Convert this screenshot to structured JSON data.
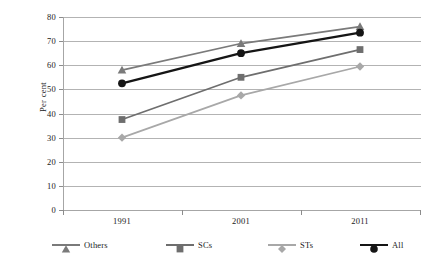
{
  "chart_data": {
    "type": "line",
    "title": "",
    "xlabel": "",
    "ylabel": "Per cent",
    "categories": [
      "1991",
      "2001",
      "2011"
    ],
    "ylim": [
      0,
      80
    ],
    "yticks": [
      0,
      10,
      20,
      30,
      40,
      50,
      60,
      70,
      80
    ],
    "grid": true,
    "legend_position": "bottom",
    "series": [
      {
        "name": "Others",
        "values": [
          58,
          69,
          76
        ],
        "color": "#7a7a7a",
        "marker": "triangle"
      },
      {
        "name": "SCs",
        "values": [
          37.5,
          55,
          66.5
        ],
        "color": "#6e6e6e",
        "marker": "square"
      },
      {
        "name": "STs",
        "values": [
          30,
          47.5,
          59.5
        ],
        "color": "#a8a8a8",
        "marker": "diamond"
      },
      {
        "name": "All",
        "values": [
          52.5,
          65,
          73.5
        ],
        "color": "#151515",
        "marker": "circle"
      }
    ]
  },
  "axis": {
    "y_title": "Per cent",
    "y_tick_labels": [
      "80",
      "70",
      "60",
      "50",
      "40",
      "30",
      "20",
      "10",
      "0"
    ],
    "x_tick_labels": [
      "1991",
      "2001",
      "2011"
    ]
  },
  "legend": {
    "items": [
      {
        "label": "Others",
        "color": "#7a7a7a",
        "marker": "triangle"
      },
      {
        "label": "SCs",
        "color": "#6e6e6e",
        "marker": "square"
      },
      {
        "label": "STs",
        "color": "#a8a8a8",
        "marker": "diamond"
      },
      {
        "label": "All",
        "color": "#151515",
        "marker": "circle"
      }
    ]
  }
}
